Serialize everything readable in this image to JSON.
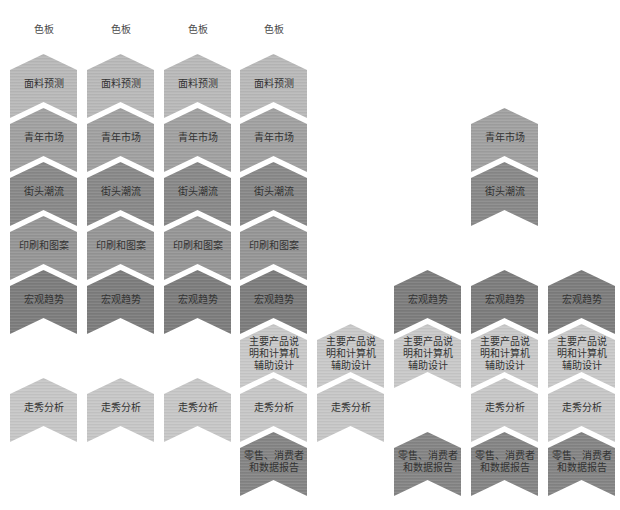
{
  "diagram": {
    "text_color": "#333333",
    "rows": [
      {
        "row": 0,
        "label": "色板",
        "color": "#ffffff"
      },
      {
        "row": 1,
        "label": "面料预测",
        "color": "#b9b9b9"
      },
      {
        "row": 2,
        "label": "青年市场",
        "color": "#a1a1a1"
      },
      {
        "row": 3,
        "label": "街头潮流",
        "color": "#898989"
      },
      {
        "row": 4,
        "label": "印刷和图案",
        "color": "#969696"
      },
      {
        "row": 5,
        "label": "宏观趋势",
        "color": "#7d7d7d"
      },
      {
        "row": 6,
        "label": "主要产品说明和计算机辅助设计",
        "color": "#c9c9c9"
      },
      {
        "row": 7,
        "label": "走秀分析",
        "color": "#c7c7c7"
      },
      {
        "row": 8,
        "label": "零售、消费者和数据报告",
        "color": "#858585"
      }
    ],
    "columns": [
      {
        "cells": [
          {
            "row": 0,
            "lines": [
              "色板"
            ]
          },
          {
            "row": 1,
            "lines": [
              "面料预测"
            ]
          },
          {
            "row": 2,
            "lines": [
              "青年市场"
            ]
          },
          {
            "row": 3,
            "lines": [
              "街头潮流"
            ]
          },
          {
            "row": 4,
            "lines": [
              "印刷和图案"
            ]
          },
          {
            "row": 5,
            "lines": [
              "宏观趋势"
            ]
          },
          {
            "row": 7,
            "lines": [
              "走秀分析"
            ]
          }
        ]
      },
      {
        "cells": [
          {
            "row": 0,
            "lines": [
              "色板"
            ]
          },
          {
            "row": 1,
            "lines": [
              "面料预测"
            ]
          },
          {
            "row": 2,
            "lines": [
              "青年市场"
            ]
          },
          {
            "row": 3,
            "lines": [
              "街头潮流"
            ]
          },
          {
            "row": 4,
            "lines": [
              "印刷和图案"
            ]
          },
          {
            "row": 5,
            "lines": [
              "宏观趋势"
            ]
          },
          {
            "row": 7,
            "lines": [
              "走秀分析"
            ]
          }
        ]
      },
      {
        "cells": [
          {
            "row": 0,
            "lines": [
              "色板"
            ]
          },
          {
            "row": 1,
            "lines": [
              "面料预测"
            ]
          },
          {
            "row": 2,
            "lines": [
              "青年市场"
            ]
          },
          {
            "row": 3,
            "lines": [
              "街头潮流"
            ]
          },
          {
            "row": 4,
            "lines": [
              "印刷和图案"
            ]
          },
          {
            "row": 5,
            "lines": [
              "宏观趋势"
            ]
          },
          {
            "row": 7,
            "lines": [
              "走秀分析"
            ]
          }
        ]
      },
      {
        "cells": [
          {
            "row": 0,
            "lines": [
              "色板"
            ]
          },
          {
            "row": 1,
            "lines": [
              "面料预测"
            ]
          },
          {
            "row": 2,
            "lines": [
              "青年市场"
            ]
          },
          {
            "row": 3,
            "lines": [
              "街头潮流"
            ]
          },
          {
            "row": 4,
            "lines": [
              "印刷和图案"
            ]
          },
          {
            "row": 5,
            "lines": [
              "宏观趋势"
            ]
          },
          {
            "row": 6,
            "lines": [
              "主要产品说",
              "明和计算机",
              "辅助设计"
            ]
          },
          {
            "row": 7,
            "lines": [
              "走秀分析"
            ]
          },
          {
            "row": 8,
            "lines": [
              "零售、消费者",
              "和数据报告"
            ]
          }
        ]
      },
      {
        "cells": [
          {
            "row": 6,
            "lines": [
              "主要产品说",
              "明和计算机",
              "辅助设计"
            ]
          },
          {
            "row": 7,
            "lines": [
              "走秀分析"
            ]
          }
        ]
      },
      {
        "cells": [
          {
            "row": 5,
            "lines": [
              "宏观趋势"
            ]
          },
          {
            "row": 6,
            "lines": [
              "主要产品说",
              "明和计算机",
              "辅助设计"
            ]
          },
          {
            "row": 8,
            "lines": [
              "零售、消费者",
              "和数据报告"
            ]
          }
        ]
      },
      {
        "cells": [
          {
            "row": 2,
            "lines": [
              "青年市场"
            ]
          },
          {
            "row": 3,
            "lines": [
              "街头潮流"
            ]
          },
          {
            "row": 5,
            "lines": [
              "宏观趋势"
            ]
          },
          {
            "row": 6,
            "lines": [
              "主要产品说",
              "明和计算机",
              "辅助设计"
            ]
          },
          {
            "row": 7,
            "lines": [
              "走秀分析"
            ]
          },
          {
            "row": 8,
            "lines": [
              "零售、消费者",
              "和数据报告"
            ]
          }
        ]
      },
      {
        "cells": [
          {
            "row": 5,
            "lines": [
              "宏观趋势"
            ]
          },
          {
            "row": 6,
            "lines": [
              "主要产品说",
              "明和计算机",
              "辅助设计"
            ]
          },
          {
            "row": 7,
            "lines": [
              "走秀分析"
            ]
          },
          {
            "row": 8,
            "lines": [
              "零售、消费者",
              "和数据报告"
            ]
          }
        ]
      }
    ]
  }
}
